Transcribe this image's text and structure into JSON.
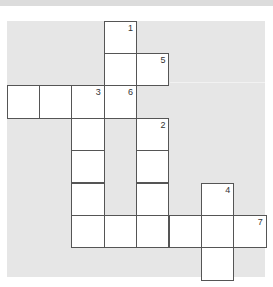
{
  "crossword": {
    "cell_size": 32.4,
    "origin": {
      "x": 7,
      "y": 21
    },
    "colors": {
      "panel": "#e6e6e6",
      "cell": "#ffffff",
      "border": "#555555",
      "number": "#333333"
    },
    "cells": [
      {
        "row": 0,
        "col": 3,
        "number": "1"
      },
      {
        "row": 1,
        "col": 3,
        "number": ""
      },
      {
        "row": 1,
        "col": 4,
        "number": "5"
      },
      {
        "row": 2,
        "col": 0,
        "number": ""
      },
      {
        "row": 2,
        "col": 1,
        "number": ""
      },
      {
        "row": 2,
        "col": 2,
        "number": "3"
      },
      {
        "row": 2,
        "col": 3,
        "number": "6"
      },
      {
        "row": 3,
        "col": 2,
        "number": ""
      },
      {
        "row": 3,
        "col": 4,
        "number": "2"
      },
      {
        "row": 4,
        "col": 2,
        "number": ""
      },
      {
        "row": 4,
        "col": 4,
        "number": ""
      },
      {
        "row": 5,
        "col": 2,
        "number": ""
      },
      {
        "row": 5,
        "col": 4,
        "number": ""
      },
      {
        "row": 5,
        "col": 6,
        "number": "4"
      },
      {
        "row": 6,
        "col": 2,
        "number": ""
      },
      {
        "row": 6,
        "col": 3,
        "number": ""
      },
      {
        "row": 6,
        "col": 4,
        "number": ""
      },
      {
        "row": 6,
        "col": 5,
        "number": ""
      },
      {
        "row": 6,
        "col": 6,
        "number": ""
      },
      {
        "row": 6,
        "col": 7,
        "number": "7"
      },
      {
        "row": 7,
        "col": 6,
        "number": ""
      }
    ]
  }
}
